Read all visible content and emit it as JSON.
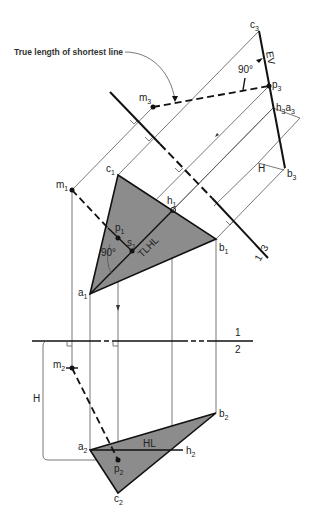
{
  "annotation": {
    "text": "True length of shortest line"
  },
  "labels": {
    "c3": {
      "base": "c",
      "sub": "3"
    },
    "p3": {
      "base": "p",
      "sub": "3"
    },
    "h3a3": {
      "base": "h",
      "sub": "3",
      "base2": "a",
      "sub2": "3"
    },
    "b3": {
      "base": "b",
      "sub": "3"
    },
    "m3": {
      "base": "m",
      "sub": "3"
    },
    "ev": "EV",
    "angle_top": "90°",
    "H_top": "H",
    "fold_13_a": "1",
    "fold_13_b": "3",
    "c1": {
      "base": "c",
      "sub": "1"
    },
    "m1": {
      "base": "m",
      "sub": "1"
    },
    "h1": {
      "base": "h",
      "sub": "1"
    },
    "p1": {
      "base": "p",
      "sub": "1"
    },
    "s1": {
      "base": "s",
      "sub": "1"
    },
    "tlhl": "TLHL",
    "angle_mid": "90°",
    "b1": {
      "base": "b",
      "sub": "1"
    },
    "a1": {
      "base": "a",
      "sub": "1"
    },
    "fold_12_a": "1",
    "fold_12_b": "2",
    "m2": {
      "base": "m",
      "sub": "2"
    },
    "H_bottom": "H",
    "b2": {
      "base": "b",
      "sub": "2"
    },
    "a2": {
      "base": "a",
      "sub": "2"
    },
    "hl": "HL",
    "h2": {
      "base": "h",
      "sub": "2"
    },
    "p2": {
      "base": "p",
      "sub": "2"
    },
    "c2": {
      "base": "c",
      "sub": "2"
    }
  },
  "colors": {
    "plane_fill": "#8c8c8c",
    "line": "#111111",
    "projection": "#555555"
  }
}
